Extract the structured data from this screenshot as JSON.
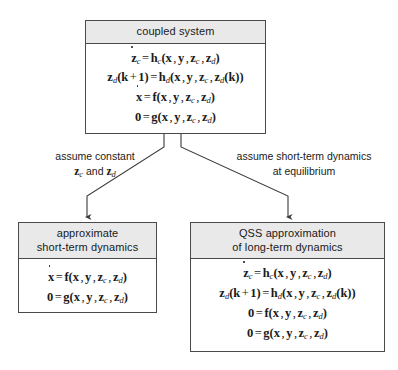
{
  "diagram": {
    "colors": {
      "header_fill": "#e9e9e9",
      "border": "#4a4a4a",
      "background": "#ffffff",
      "text": "#1a1a1a"
    },
    "nodes": [
      {
        "id": "coupled-system",
        "header": "coupled system",
        "equations": [
          "ż_c = h_c(x, y, z_c, z_d)",
          "z_d(k + 1) = h_d(x, y, z_c, z_d(k))",
          "ẋ = f(x, y, z_c, z_d)",
          "0 = g(x, y, z_c, z_d)"
        ]
      },
      {
        "id": "approximate-short-term-dynamics",
        "header_line1": "approximate",
        "header_line2": "short-term dynamics",
        "equations": [
          "ẋ = f(x, y, z_c, z_d)",
          "0 = g(x, y, z_c, z_d)"
        ]
      },
      {
        "id": "qss-approximation-long-term-dynamics",
        "header_line1": "QSS approximation",
        "header_line2": "of long-term dynamics",
        "equations": [
          "ż_c = h_c(x, y, z_c, z_d)",
          "z_d(k + 1) = h_d(x, y, z_c, z_d(k))",
          "0 = f(x, y, z_c, z_d)",
          "0 = g(x, y, z_c, z_d)"
        ]
      }
    ],
    "edges": [
      {
        "id": "left-branch",
        "from": "coupled-system",
        "to": "approximate-short-term-dynamics",
        "label_line1": "assume constant",
        "label_line2_prefix": "z",
        "label_line2_sub1": "c",
        "label_line2_mid": " and ",
        "label_line2_prefix2": "z",
        "label_line2_sub2": "d"
      },
      {
        "id": "right-branch",
        "from": "coupled-system",
        "to": "qss-approximation-long-term-dynamics",
        "label_line1": "assume short-term dynamics",
        "label_line2": "at equilibrium"
      }
    ]
  }
}
